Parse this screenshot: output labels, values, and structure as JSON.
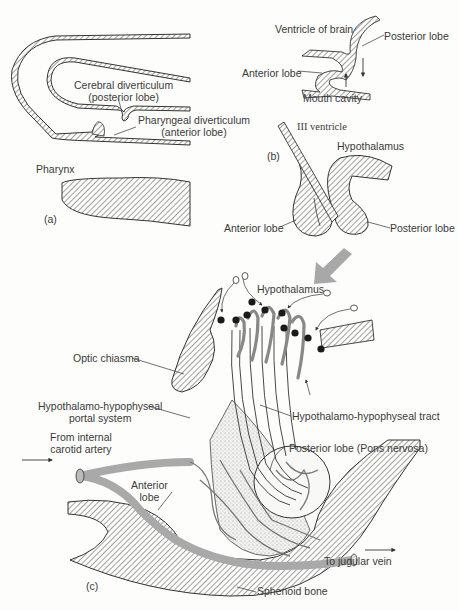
{
  "figure": {
    "panels": {
      "a": {
        "tag": "(a)",
        "labels": {
          "cerebral_line1": "Cerebral diverticulum",
          "cerebral_line2": "(posterior lobe)",
          "pharyngeal_line1": "Pharyngeal diverticulum",
          "pharyngeal_line2": "(anterior lobe)",
          "pharynx": "Pharynx"
        }
      },
      "b": {
        "tag": "(b)",
        "labels": {
          "ventricle_of_brain": "Ventricle of brain",
          "posterior_lobe_top": "Posterior lobe",
          "anterior_lobe_top": "Anterior lobe",
          "mouth_cavity": "Mouth cavity",
          "iii_ventricle": "III ventricle",
          "hypothalamus": "Hypothalamus",
          "anterior_lobe": "Anterior lobe",
          "posterior_lobe": "Posterior lobe"
        }
      },
      "c": {
        "tag": "(c)",
        "labels": {
          "hypothalamus": "Hypothalamus",
          "optic_chiasma": "Optic chiasma",
          "portal_line1": "Hypothalamo-hypophyseal",
          "portal_line2": "portal system",
          "tract": "Hypothalamo-hypophyseal tract",
          "carotid_line1": "From internal",
          "carotid_line2": "carotid artery",
          "posterior_lobe": "Posterior lobe  (Pons nervosa)",
          "anterior_line1": "Anterior",
          "anterior_line2": "lobe",
          "jugular": "To jugular vein",
          "sphenoid": "Sphenoid bone"
        }
      }
    },
    "colors": {
      "line": "#3a3a3a",
      "vessel": "#a9a9a9",
      "hatch": "#555555",
      "transition_arrow": "#a8a8a8",
      "neuron_body": "#1a1a1a"
    }
  }
}
